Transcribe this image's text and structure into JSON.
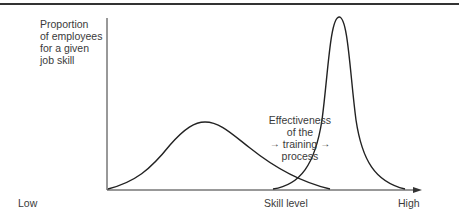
{
  "diagram": {
    "y_axis_label": [
      "Proportion",
      "of employees",
      "for a given",
      "job skill"
    ],
    "x_axis": {
      "low": "Low",
      "title": "Skill level",
      "high": "High"
    },
    "annotation": {
      "lines": [
        "Effectiveness",
        "of the",
        "training",
        "process"
      ],
      "arrow_glyph": "→"
    },
    "curves": [
      {
        "name": "before-training",
        "description": "broad distribution peaked at low-to-mid skill"
      },
      {
        "name": "after-training",
        "description": "narrow tall distribution peaked near high skill"
      }
    ],
    "colors": {
      "line": "#222222",
      "text": "#3a3a3a"
    }
  }
}
